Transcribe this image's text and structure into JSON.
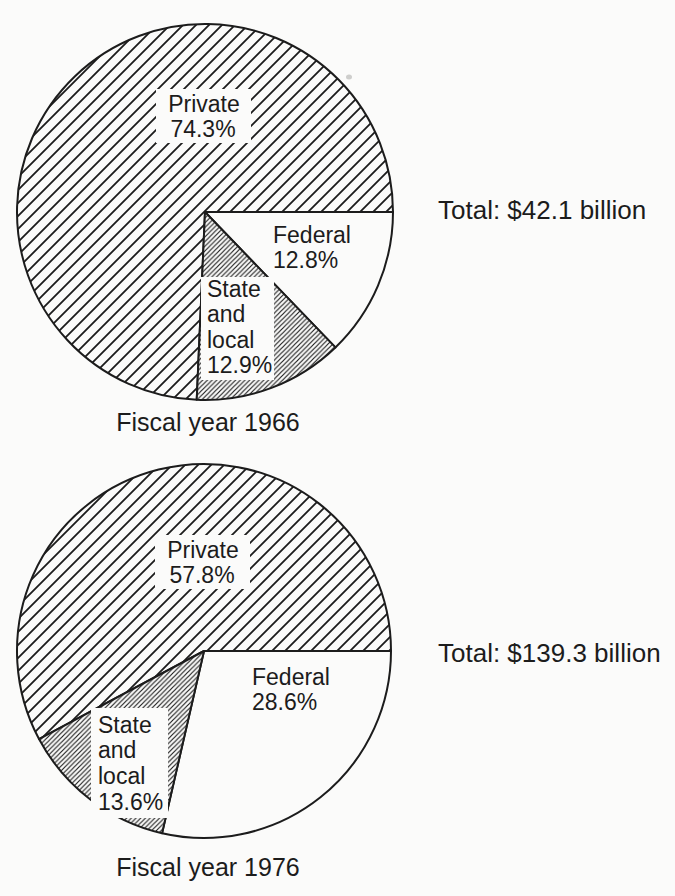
{
  "figure": {
    "kind": "scanned textbook figure with two pie charts",
    "ink_color": "#1c1c1c",
    "paper_color": "#fbfbfa"
  },
  "chart_data": [
    {
      "type": "pie",
      "caption": "Fiscal year 1966",
      "total_label": "Total: $42.1 billion",
      "total_billion_usd": 42.1,
      "units": "percent of total",
      "start_angle_deg": 0,
      "direction": "clockwise",
      "draw_order_from_east": [
        "Federal",
        "State and local",
        "Private"
      ],
      "slices": [
        {
          "name": "Private",
          "value": 74.3,
          "display": "74.3%",
          "fill_style": "wide-diagonal-hatch",
          "label_lines": [
            "Private",
            "74.3%"
          ]
        },
        {
          "name": "Federal",
          "value": 12.8,
          "display": "12.8%",
          "fill_style": "white",
          "label_lines": [
            "Federal",
            "12.8%"
          ]
        },
        {
          "name": "State and local",
          "value": 12.9,
          "display": "12.9%",
          "fill_style": "dense-diagonal-hatch",
          "label_lines": [
            "State",
            "and",
            "local",
            "12.9%"
          ]
        }
      ]
    },
    {
      "type": "pie",
      "caption": "Fiscal year 1976",
      "total_label": "Total: $139.3 billion",
      "total_billion_usd": 139.3,
      "units": "percent of total",
      "start_angle_deg": 0,
      "direction": "clockwise",
      "draw_order_from_east": [
        "Federal",
        "State and local",
        "Private"
      ],
      "slices": [
        {
          "name": "Private",
          "value": 57.8,
          "display": "57.8%",
          "fill_style": "wide-diagonal-hatch",
          "label_lines": [
            "Private",
            "57.8%"
          ]
        },
        {
          "name": "Federal",
          "value": 28.6,
          "display": "28.6%",
          "fill_style": "white",
          "label_lines": [
            "Federal",
            "28.6%"
          ]
        },
        {
          "name": "State and local",
          "value": 13.6,
          "display": "13.6%",
          "fill_style": "dense-diagonal-hatch",
          "label_lines": [
            "State",
            "and",
            "local",
            "13.6%"
          ]
        }
      ]
    }
  ]
}
